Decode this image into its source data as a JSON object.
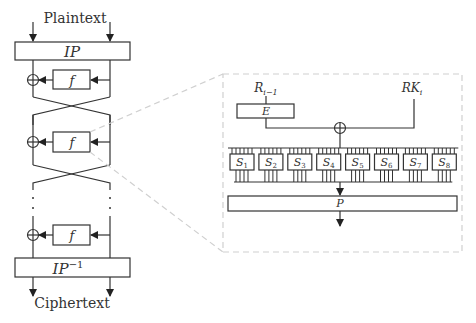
{
  "diagram": {
    "input_label": "Plaintext",
    "output_label": "Ciphertext",
    "ip_label": "IP",
    "ip_inverse_label": "IP",
    "ip_inverse_sup": "−1",
    "round_function_label": "f",
    "rounds_shown": 3,
    "detail": {
      "r_prev_label": "R",
      "r_prev_sub": "i−1",
      "expansion_label": "E",
      "round_key_label": "RK",
      "round_key_sub": "i",
      "sboxes": [
        {
          "label": "S",
          "sub": "1"
        },
        {
          "label": "S",
          "sub": "2"
        },
        {
          "label": "S",
          "sub": "3"
        },
        {
          "label": "S",
          "sub": "4"
        },
        {
          "label": "S",
          "sub": "5"
        },
        {
          "label": "S",
          "sub": "6"
        },
        {
          "label": "S",
          "sub": "7"
        },
        {
          "label": "S",
          "sub": "8"
        }
      ],
      "permutation_label": "P"
    },
    "colors": {
      "line": "#333333",
      "dashed": "#cccccc",
      "background": "#ffffff"
    }
  }
}
